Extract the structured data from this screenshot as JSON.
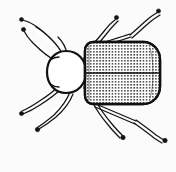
{
  "figure": {
    "title": "Beetle dorsal view line drawing",
    "subject": "beetle",
    "view": "dorsal",
    "style": "black ink line drawing, stippled elytra",
    "width": 176,
    "height": 172,
    "background_color": "#fbfbfb",
    "ink_color": "#111111",
    "fill_color": "#ffffff"
  },
  "anatomy": {
    "head": {
      "label": "head and pronotum",
      "description": "rounded oval capsule at left of body, unshaded white with dark outline",
      "center_x": 66,
      "center_y": 72,
      "radius_x": 19,
      "radius_y": 21
    },
    "elytra": {
      "label": "elytra",
      "description": "broad rounded-rectangular wing covers, densely punctate with rows of dots, divided by a central transverse suture",
      "left_x": 85,
      "right_x": 160,
      "top_y": 42,
      "bottom_y": 104,
      "corner_radius": 9,
      "suture_y": 73,
      "texture": "punctate-striae-dots",
      "texture_dot_color": "#222222",
      "texture_dot_spacing_x": 3.1,
      "texture_dot_spacing_y": 3.0
    },
    "legs": [
      {
        "name": "leg-front-left",
        "label": "front left leg",
        "direction": "upper-left"
      },
      {
        "name": "leg-middle-left",
        "label": "middle left leg",
        "direction": "lower-left"
      },
      {
        "name": "leg-hind-left",
        "label": "hind left leg",
        "direction": "lower-left-far"
      },
      {
        "name": "leg-front-right",
        "label": "front right leg",
        "direction": "upper-right-inner"
      },
      {
        "name": "leg-middle-right",
        "label": "middle right leg",
        "direction": "upper-right-outer"
      },
      {
        "name": "leg-hind-right",
        "label": "hind right leg",
        "direction": "lower-right-inner"
      },
      {
        "name": "leg-hind-right-outer",
        "label": "hind right outer leg",
        "direction": "lower-right-outer"
      }
    ],
    "antennae": [
      {
        "name": "antenna-left",
        "label": "left antenna",
        "direction": "upper-left"
      }
    ],
    "counts": {
      "legs_visible": 6,
      "antennae_visible": 1
    }
  }
}
